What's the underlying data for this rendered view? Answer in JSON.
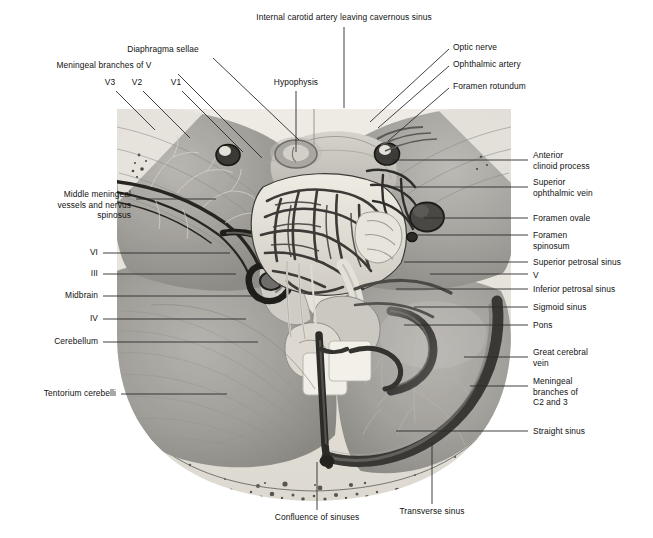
{
  "figure": {
    "type": "anatomical-illustration",
    "palette": {
      "background": "#ffffff",
      "text": "#111111",
      "leader_line": "#2b2b2b",
      "dura_light": "#c9c7c2",
      "dura_mid": "#a8a6a2",
      "dura_dark": "#7e7c78",
      "bone_pale": "#e6e3dc",
      "sinus_dark": "#4a4845",
      "vessel_dark": "#2f2e2c",
      "highlight": "#efece5"
    },
    "frame": {
      "x": 115,
      "y": 105,
      "width": 398,
      "height": 398
    }
  },
  "labels": {
    "top": [
      {
        "id": "internal-carotid-artery",
        "text": "Internal carotid artery leaving cavernous sinus",
        "align": "center",
        "x": 344,
        "y": 12,
        "leader": [
          [
            344,
            27
          ],
          [
            344,
            108
          ]
        ]
      },
      {
        "id": "diaphragma-sellae",
        "text": "Diaphragma sellae",
        "align": "center",
        "x": 163,
        "y": 44,
        "leader": [
          [
            213,
            58
          ],
          [
            299,
            140
          ]
        ]
      },
      {
        "id": "meningeal-branches-of-v",
        "text": "Meningeal branches of V",
        "align": "center",
        "x": 104,
        "y": 60,
        "leader": [
          [
            178,
            74
          ],
          [
            262,
            158
          ]
        ]
      },
      {
        "id": "v3",
        "text": "V3",
        "align": "center",
        "x": 110,
        "y": 77,
        "leader": [
          [
            116,
            91
          ],
          [
            155,
            130
          ]
        ]
      },
      {
        "id": "v2",
        "text": "V2",
        "align": "center",
        "x": 137,
        "y": 77,
        "leader": [
          [
            143,
            91
          ],
          [
            190,
            138
          ]
        ]
      },
      {
        "id": "v1",
        "text": "V1",
        "align": "center",
        "x": 176,
        "y": 77,
        "leader": [
          [
            182,
            91
          ],
          [
            243,
            152
          ]
        ]
      },
      {
        "id": "hypophysis",
        "text": "Hypophysis",
        "align": "center",
        "x": 296,
        "y": 77,
        "leader": [
          [
            296,
            91
          ],
          [
            296,
            152
          ]
        ]
      },
      {
        "id": "optic-nerve",
        "text": "Optic nerve",
        "align": "left",
        "x": 453,
        "y": 42,
        "leader": [
          [
            449,
            49
          ],
          [
            370,
            122
          ]
        ]
      },
      {
        "id": "ophthalmic-artery",
        "text": "Ophthalmic artery",
        "align": "left",
        "x": 453,
        "y": 59,
        "leader": [
          [
            449,
            66
          ],
          [
            378,
            128
          ]
        ]
      },
      {
        "id": "foramen-rotundum",
        "text": "Foramen rotundum",
        "align": "left",
        "x": 453,
        "y": 81,
        "leader": [
          [
            449,
            88
          ],
          [
            388,
            141
          ]
        ]
      }
    ],
    "left": [
      {
        "id": "middle-meningeal-vessels",
        "text": "Middle meningeal\nvessels and nervus\nspinosus",
        "align": "right",
        "x": 131,
        "y": 194,
        "leader": [
          [
            136,
            199
          ],
          [
            216,
            199
          ]
        ]
      },
      {
        "id": "nerve-vi",
        "text": "VI",
        "align": "right",
        "x": 98,
        "y": 249,
        "leader": [
          [
            103,
            253
          ],
          [
            230,
            253
          ]
        ]
      },
      {
        "id": "nerve-iii",
        "text": "III",
        "align": "right",
        "x": 98,
        "y": 270,
        "leader": [
          [
            103,
            274
          ],
          [
            236,
            274
          ]
        ]
      },
      {
        "id": "midbrain",
        "text": "Midbrain",
        "align": "right",
        "x": 98,
        "y": 292,
        "leader": [
          [
            103,
            296
          ],
          [
            255,
            296
          ]
        ]
      },
      {
        "id": "nerve-iv",
        "text": "IV",
        "align": "right",
        "x": 98,
        "y": 315,
        "leader": [
          [
            103,
            319
          ],
          [
            246,
            319
          ]
        ]
      },
      {
        "id": "cerebellum",
        "text": "Cerebellum",
        "align": "right",
        "x": 98,
        "y": 338,
        "leader": [
          [
            103,
            342
          ],
          [
            258,
            342
          ]
        ]
      },
      {
        "id": "tentorium-cerebelli",
        "text": "Tentorium cerebelli",
        "align": "right",
        "x": 116,
        "y": 390,
        "leader": [
          [
            121,
            394
          ],
          [
            227,
            394
          ]
        ]
      }
    ],
    "right": [
      {
        "id": "anterior-clinoid-process",
        "text": "Anterior\nclinoid process",
        "align": "left",
        "x": 533,
        "y": 155,
        "leader": [
          [
            528,
            160
          ],
          [
            392,
            160
          ]
        ]
      },
      {
        "id": "superior-ophthalmic-vein",
        "text": "Superior\nophthalmic vein",
        "align": "left",
        "x": 533,
        "y": 182,
        "leader": [
          [
            528,
            187
          ],
          [
            388,
            187
          ]
        ]
      },
      {
        "id": "foramen-ovale",
        "text": "Foramen ovale",
        "align": "left",
        "x": 533,
        "y": 213,
        "leader": [
          [
            528,
            218
          ],
          [
            424,
            218
          ]
        ]
      },
      {
        "id": "foramen-spinosum",
        "text": "Foramen\nspinosum",
        "align": "left",
        "x": 533,
        "y": 230,
        "leader": [
          [
            528,
            235
          ],
          [
            412,
            235
          ]
        ]
      },
      {
        "id": "superior-petrosal-sinus",
        "text": "Superior petrosal sinus",
        "align": "left",
        "x": 533,
        "y": 257,
        "leader": [
          [
            528,
            262
          ],
          [
            404,
            262
          ]
        ]
      },
      {
        "id": "nerve-v",
        "text": "V",
        "align": "left",
        "x": 533,
        "y": 270,
        "leader": [
          [
            528,
            274
          ],
          [
            430,
            274
          ]
        ]
      },
      {
        "id": "inferior-petrosal-sinus",
        "text": "Inferior petrosal sinus",
        "align": "left",
        "x": 533,
        "y": 284,
        "leader": [
          [
            528,
            289
          ],
          [
            396,
            289
          ]
        ]
      },
      {
        "id": "sigmoid-sinus",
        "text": "Sigmoid sinus",
        "align": "left",
        "x": 533,
        "y": 302,
        "leader": [
          [
            528,
            307
          ],
          [
            414,
            307
          ]
        ]
      },
      {
        "id": "pons",
        "text": "Pons",
        "align": "left",
        "x": 533,
        "y": 320,
        "leader": [
          [
            528,
            325
          ],
          [
            404,
            325
          ]
        ]
      },
      {
        "id": "great-cerebral-vein",
        "text": "Great cerebral\nvein",
        "align": "left",
        "x": 533,
        "y": 352,
        "leader": [
          [
            528,
            357
          ],
          [
            464,
            357
          ]
        ]
      },
      {
        "id": "meningeal-branches-c2-c3",
        "text": "Meningeal\nbranches of\nC2 and 3",
        "align": "left",
        "x": 533,
        "y": 381,
        "leader": [
          [
            528,
            386
          ],
          [
            470,
            386
          ]
        ]
      },
      {
        "id": "straight-sinus",
        "text": "Straight sinus",
        "align": "left",
        "x": 533,
        "y": 426,
        "leader": [
          [
            528,
            431
          ],
          [
            396,
            431
          ]
        ]
      }
    ],
    "bottom": [
      {
        "id": "confluence-of-sinuses",
        "text": "Confluence of sinuses",
        "align": "center",
        "x": 317,
        "y": 517,
        "leader": [
          [
            317,
            510
          ],
          [
            317,
            462
          ]
        ]
      },
      {
        "id": "transverse-sinus",
        "text": "Transverse sinus",
        "align": "center",
        "x": 432,
        "y": 511,
        "leader": [
          [
            432,
            504
          ],
          [
            432,
            442
          ]
        ]
      }
    ]
  }
}
